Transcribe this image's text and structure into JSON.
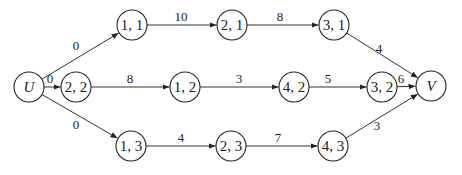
{
  "diagram": {
    "type": "directed-network",
    "nodes": [
      {
        "id": "U",
        "label": "U",
        "x": 29,
        "y": 87,
        "italic": true
      },
      {
        "id": "11",
        "label": "1, 1",
        "x": 132,
        "y": 25
      },
      {
        "id": "21",
        "label": "2, 1",
        "x": 232,
        "y": 25
      },
      {
        "id": "31",
        "label": "3, 1",
        "x": 334,
        "y": 25
      },
      {
        "id": "22",
        "label": "2, 2",
        "x": 76,
        "y": 87
      },
      {
        "id": "12",
        "label": "1, 2",
        "x": 185,
        "y": 87
      },
      {
        "id": "42",
        "label": "4, 2",
        "x": 294,
        "y": 87
      },
      {
        "id": "32",
        "label": "3, 2",
        "x": 382,
        "y": 87
      },
      {
        "id": "V",
        "label": "V",
        "x": 431,
        "y": 86,
        "italic": true
      },
      {
        "id": "13",
        "label": "1, 3",
        "x": 131,
        "y": 146
      },
      {
        "id": "23",
        "label": "2, 3",
        "x": 231,
        "y": 146
      },
      {
        "id": "43",
        "label": "4, 3",
        "x": 333,
        "y": 146
      }
    ],
    "edges": [
      {
        "from": "U",
        "to": "11",
        "weight": "0",
        "lx": 76,
        "ly": 50
      },
      {
        "from": "U",
        "to": "22",
        "weight": "0",
        "lx": 50,
        "ly": 83
      },
      {
        "from": "U",
        "to": "13",
        "weight": "0",
        "lx": 76,
        "ly": 129
      },
      {
        "from": "11",
        "to": "21",
        "weight": "10",
        "lx": 181,
        "ly": 21
      },
      {
        "from": "21",
        "to": "31",
        "weight": "8",
        "lx": 280,
        "ly": 21
      },
      {
        "from": "31",
        "to": "V",
        "weight": "4",
        "lx": 379,
        "ly": 53
      },
      {
        "from": "22",
        "to": "12",
        "weight": "8",
        "lx": 130,
        "ly": 83
      },
      {
        "from": "12",
        "to": "42",
        "weight": "3",
        "lx": 239,
        "ly": 83
      },
      {
        "from": "42",
        "to": "32",
        "weight": "5",
        "lx": 328,
        "ly": 83
      },
      {
        "from": "32",
        "to": "V",
        "weight": "6",
        "lx": 401,
        "ly": 83
      },
      {
        "from": "13",
        "to": "23",
        "weight": "4",
        "lx": 181,
        "ly": 142
      },
      {
        "from": "23",
        "to": "43",
        "weight": "7",
        "lx": 278,
        "ly": 142
      },
      {
        "from": "43",
        "to": "V",
        "weight": "3",
        "lx": 377,
        "ly": 130
      }
    ]
  }
}
